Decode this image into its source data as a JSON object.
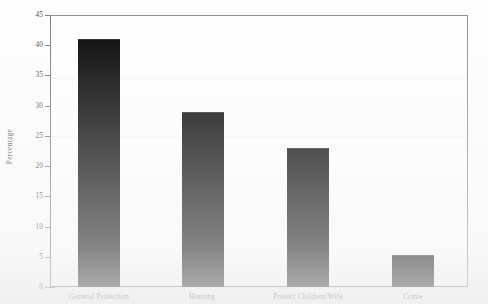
{
  "chart_data": {
    "type": "bar",
    "title": "",
    "subtitle": "",
    "xlabel": "",
    "ylabel": "Percentage",
    "categories": [
      "General Protection",
      "Hunting",
      "Protect Children/Wife",
      "Crime"
    ],
    "values": [
      41,
      29,
      23,
      5.3
    ],
    "series": [
      {
        "name": "Percentage",
        "values": [
          41,
          29,
          23,
          5.3
        ],
        "color": "#000000"
      }
    ],
    "ylim": [
      0,
      45
    ],
    "ytick_labels": [
      "0",
      "5",
      "10",
      "15",
      "20",
      "25",
      "30",
      "35",
      "40",
      "45"
    ],
    "ytick_values": [
      0,
      5,
      10,
      15,
      20,
      25,
      30,
      35,
      40,
      45
    ],
    "grid": false,
    "legend": false,
    "legend_position": "none",
    "bar_color": "#000000",
    "axis_color": "#7e7e7e",
    "background_color": "#ffffff",
    "annotations": []
  },
  "axes": {
    "y_title": "Percentage",
    "ticks": [
      {
        "label": "45",
        "value": 45
      },
      {
        "label": "40",
        "value": 40
      },
      {
        "label": "35",
        "value": 35
      },
      {
        "label": "30",
        "value": 30
      },
      {
        "label": "25",
        "value": 25
      },
      {
        "label": "20",
        "value": 20
      },
      {
        "label": "15",
        "value": 15
      },
      {
        "label": "10",
        "value": 10
      },
      {
        "label": "5",
        "value": 5
      },
      {
        "label": "0",
        "value": 0
      }
    ]
  },
  "bars": [
    {
      "label": "General Protection",
      "value": 41
    },
    {
      "label": "Hunting",
      "value": 29
    },
    {
      "label": "Protect Children/Wife",
      "value": 23
    },
    {
      "label": "Crime",
      "value": 5.3
    }
  ]
}
